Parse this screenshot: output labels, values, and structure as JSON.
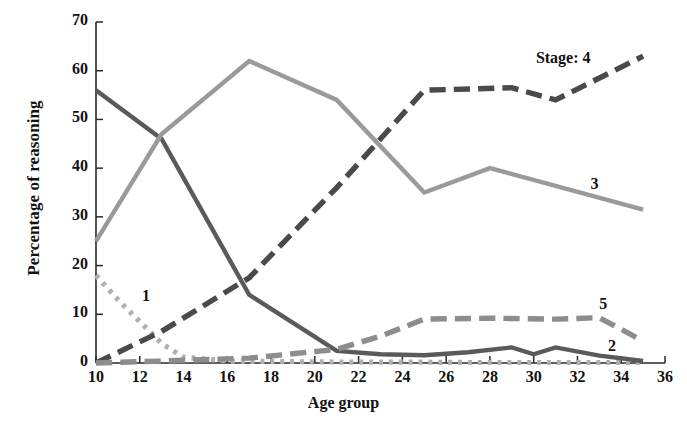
{
  "chart_data": {
    "type": "line",
    "title": "",
    "xlabel": "Age group",
    "ylabel": "Percentage of reasoning",
    "xlim": [
      10,
      36
    ],
    "ylim": [
      0,
      70
    ],
    "xticks": [
      10,
      12,
      14,
      16,
      18,
      20,
      22,
      24,
      26,
      28,
      30,
      32,
      34,
      36
    ],
    "yticks": [
      0,
      10,
      20,
      30,
      40,
      50,
      60,
      70
    ],
    "grid": false,
    "legend_position": "inline-labels",
    "legend_prefix": "Stage:",
    "series": [
      {
        "name": "1",
        "label": "1",
        "style": "dotted",
        "color": "#b0b0b0",
        "x": [
          10,
          11,
          12,
          13,
          14,
          16,
          18,
          21,
          24,
          27,
          30,
          33,
          35
        ],
        "values": [
          18,
          13,
          8.5,
          4,
          1.2,
          0.4,
          0.3,
          0.2,
          0.2,
          0.1,
          0.1,
          0.1,
          0.1
        ],
        "label_x": 12.1,
        "label_y": 13.5
      },
      {
        "name": "2",
        "label": "2",
        "style": "solid",
        "color": "#5a5a5a",
        "x": [
          10,
          13,
          17,
          21,
          23,
          25,
          27,
          29,
          30,
          31,
          33,
          35
        ],
        "values": [
          56,
          46,
          14,
          2.5,
          1.8,
          1.6,
          2.2,
          3.2,
          1.8,
          3.2,
          1.5,
          0.4
        ],
        "label_x": 33.4,
        "label_y": 3.2
      },
      {
        "name": "3",
        "label": "3",
        "style": "solid",
        "color": "#9a9a9a",
        "x": [
          10,
          13,
          17,
          21,
          25,
          28,
          35
        ],
        "values": [
          25,
          47,
          62,
          54,
          35,
          40,
          31.5
        ],
        "label_x": 32.6,
        "label_y": 36.5
      },
      {
        "name": "4",
        "label": "Stage: 4",
        "style": "dashed",
        "color": "#4a4a4a",
        "x": [
          10,
          13,
          17,
          21,
          25,
          29,
          31,
          35
        ],
        "values": [
          0,
          6.5,
          17.5,
          36,
          56,
          56.5,
          54,
          63
        ],
        "label_x": 30.1,
        "label_y": 62.5
      },
      {
        "name": "5",
        "label": "5",
        "style": "dashed",
        "color": "#8d8d8d",
        "x": [
          10,
          13,
          17,
          21,
          23,
          25,
          28,
          31,
          33,
          35
        ],
        "values": [
          0,
          0.4,
          1.0,
          2.8,
          5.5,
          9.0,
          9.2,
          9.0,
          9.3,
          4.5
        ],
        "label_x": 33.0,
        "label_y": 12.0
      }
    ]
  },
  "axis": {
    "xlabel": "Age group",
    "ylabel": "Percentage of reasoning"
  }
}
